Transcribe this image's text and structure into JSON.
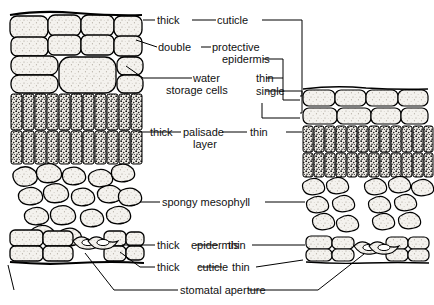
{
  "figure": {
    "panels": [
      {
        "name": "left-leaf-section",
        "modifier": "thick"
      },
      {
        "name": "right-leaf-section",
        "modifier": "thin"
      }
    ]
  },
  "labels": {
    "cuticle_top": {
      "left_qualifier": "thick",
      "term": "cuticle"
    },
    "protective_epidermis": {
      "left_qualifier": "double",
      "term_line1": "protective",
      "term_line2": "epidermis",
      "right_qualifier": "thin"
    },
    "water_storage": {
      "term_line1": "water",
      "term_line2": "storage cells",
      "right_qualifier": "single"
    },
    "palisade": {
      "left_qualifier": "thick",
      "term_line1": "palisade",
      "term_line2": "layer",
      "right_qualifier": "thin"
    },
    "spongy_mesophyll": {
      "term": "spongy  mesophyll"
    },
    "epidermis_bottom": {
      "left_qualifier": "thick",
      "term": "epidermis",
      "right_qualifier": "thin"
    },
    "cuticle_bottom": {
      "left_qualifier": "thick",
      "term": "cuticle",
      "right_qualifier": "thin"
    },
    "stomatal_aperture": {
      "term": "stomatal  aperture"
    }
  },
  "colors": {
    "ink": "#000000",
    "paper": "#ffffff",
    "cell_fill": "#f2f0ec",
    "palisade_dark": "#1a1a1a",
    "stipple": "#8a8378"
  }
}
